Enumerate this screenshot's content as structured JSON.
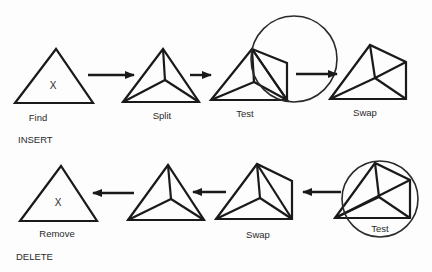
{
  "diagram": {
    "insert": {
      "section_label": "INSERT",
      "steps": [
        {
          "label": "Find",
          "marker": "X"
        },
        {
          "label": "Split"
        },
        {
          "label": "Test"
        },
        {
          "label": "Swap"
        }
      ]
    },
    "delete": {
      "section_label": "DELETE",
      "steps": [
        {
          "label": "Test"
        },
        {
          "label": "Swap"
        },
        {
          "label": ""
        },
        {
          "label": "Remove",
          "marker": "X"
        }
      ]
    },
    "colors": {
      "stroke": "#1a1a1a",
      "background": "#fdfdfd"
    }
  }
}
